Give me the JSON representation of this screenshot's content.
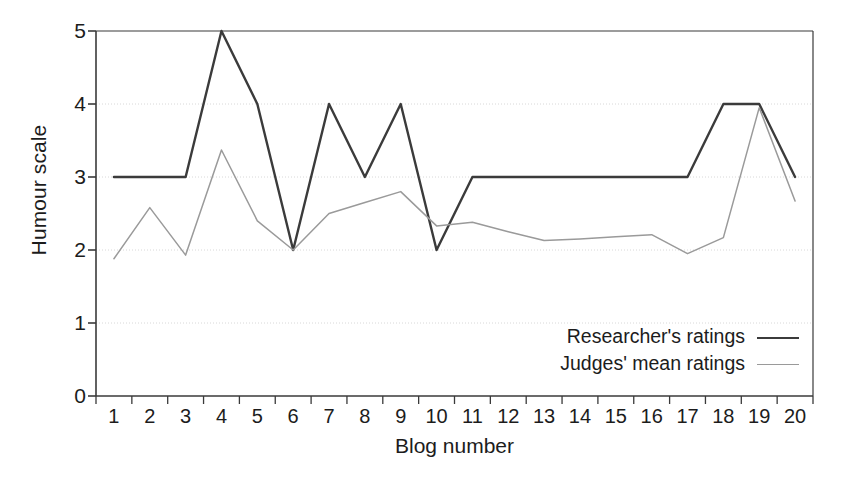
{
  "chart_data": {
    "type": "line",
    "title": "",
    "xlabel": "Blog number",
    "ylabel": "Humour scale",
    "xlim": [
      0.5,
      20.5
    ],
    "ylim": [
      0,
      5
    ],
    "yticks": [
      0,
      1,
      2,
      3,
      4,
      5
    ],
    "grid": "horizontal-dotted",
    "legend_position": "inside-lower-right",
    "categories": [
      1,
      2,
      3,
      4,
      5,
      6,
      7,
      8,
      9,
      10,
      11,
      12,
      13,
      14,
      15,
      16,
      17,
      18,
      19,
      20
    ],
    "x_tick_labels": [
      "1",
      "2",
      "3",
      "4",
      "5",
      "6",
      "7",
      "8",
      "9",
      "10",
      "11",
      "12",
      "13",
      "14",
      "15",
      "16",
      "17",
      "18",
      "19",
      "20"
    ],
    "y_tick_labels": [
      "0",
      "1",
      "2",
      "3",
      "4",
      "5"
    ],
    "series": [
      {
        "name": "Researcher's ratings",
        "color": "#3b3b3b",
        "width": 2.4,
        "values": [
          3,
          3,
          3,
          5,
          4,
          2,
          4,
          3,
          4,
          2,
          3,
          3,
          3,
          3,
          3,
          3,
          3,
          4,
          4,
          3
        ]
      },
      {
        "name": "Judges' mean ratings",
        "color": "#9a9a9a",
        "width": 1.5,
        "values": [
          1.88,
          2.58,
          1.93,
          3.37,
          2.4,
          2.0,
          2.5,
          2.65,
          2.8,
          2.33,
          2.38,
          2.25,
          2.13,
          2.15,
          2.18,
          2.21,
          1.95,
          2.17,
          3.95,
          2.67
        ]
      }
    ]
  },
  "legend": {
    "rows": [
      {
        "label": "Researcher's ratings"
      },
      {
        "label": "Judges' mean ratings"
      }
    ]
  },
  "axes": {
    "y_title": "Humour scale",
    "x_title": "Blog number"
  },
  "colors": {
    "researcher_line": "#3b3b3b",
    "judges_line": "#9a9a9a",
    "axis": "#3a3a3a",
    "grid": "#d8d8d8",
    "background": "#ffffff"
  }
}
